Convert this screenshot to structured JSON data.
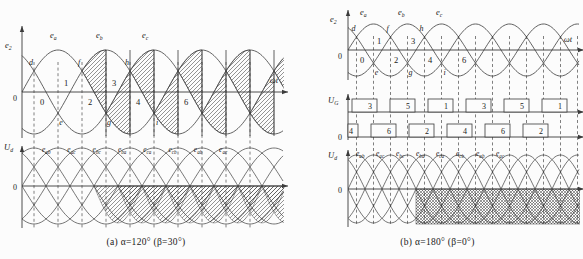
{
  "colors": {
    "line": "#3b3b3b",
    "text": "#1a1a1a",
    "background": "#fcfcfc"
  },
  "panels": {
    "a": {
      "caption": "(a) α=120°  (β=30°)",
      "top": {
        "y_axis": {
          "main": "e",
          "sub": "2"
        },
        "x_axis": "ωt",
        "origin": "0",
        "curves": [
          {
            "main": "e",
            "sub": "a"
          },
          {
            "main": "e",
            "sub": "b"
          },
          {
            "main": "e",
            "sub": "c"
          }
        ],
        "upper_crossings": [
          "d",
          "f",
          "h"
        ],
        "lower_crossings": [
          "e",
          "g",
          "i"
        ],
        "numbers": [
          "0",
          "1",
          "2",
          "3",
          "4",
          "6"
        ]
      },
      "bottom": {
        "y_axis": {
          "main": "U",
          "sub": "d"
        },
        "origin": "0",
        "segments": [
          {
            "main": "e",
            "sub": "ab"
          },
          {
            "main": "e",
            "sub": "ac"
          },
          {
            "main": "e",
            "sub": "bc"
          },
          {
            "main": "e",
            "sub": "ba"
          },
          {
            "main": "e",
            "sub": "ca"
          },
          {
            "main": "e",
            "sub": "cb"
          },
          {
            "main": "e",
            "sub": "ab"
          },
          {
            "main": "e",
            "sub": "ac"
          }
        ]
      }
    },
    "b": {
      "caption": "(b) α=180°  (β=0°)",
      "top": {
        "y_axis": {
          "main": "e",
          "sub": "2"
        },
        "x_axis": "ωt",
        "origin": "0",
        "curves": [
          {
            "main": "e",
            "sub": "a"
          },
          {
            "main": "e",
            "sub": "b"
          },
          {
            "main": "e",
            "sub": "c"
          }
        ],
        "upper_crossings": [
          "d",
          "f",
          "h"
        ],
        "lower_crossings": [
          "e",
          "g",
          "i"
        ],
        "numbers": [
          "0",
          "1",
          "2",
          "3",
          "4",
          "6"
        ]
      },
      "pulses": {
        "y_axis": {
          "main": "U",
          "sub": "G"
        },
        "origin": "0",
        "row1": [
          "3",
          "5",
          "1",
          "3",
          "5",
          "1"
        ],
        "row2": [
          "4",
          "6",
          "2",
          "4",
          "6",
          "2"
        ]
      },
      "bottom": {
        "y_axis": {
          "main": "U",
          "sub": "d"
        },
        "origin": "0",
        "segments": [
          {
            "main": "e",
            "sub": "ab"
          },
          {
            "main": "e",
            "sub": "ac"
          },
          {
            "main": "e",
            "sub": "bc"
          },
          {
            "main": "e",
            "sub": "ba"
          },
          {
            "main": "e",
            "sub": "ca"
          },
          {
            "main": "e",
            "sub": "cb"
          },
          {
            "main": "e",
            "sub": "ab"
          },
          {
            "main": "e",
            "sub": "ac"
          }
        ]
      }
    }
  }
}
